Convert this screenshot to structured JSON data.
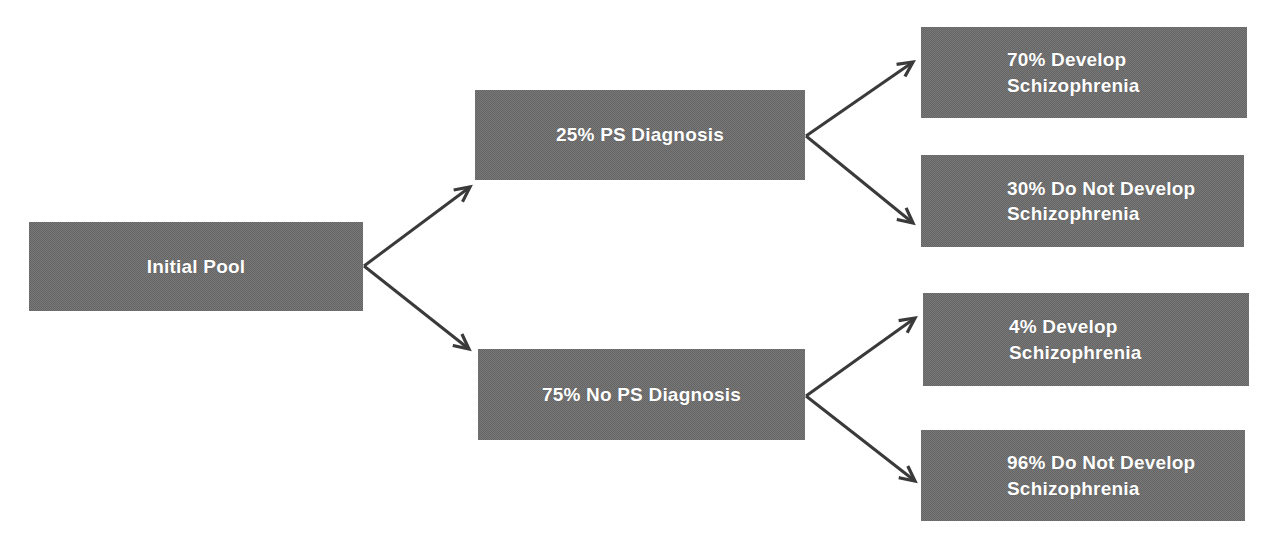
{
  "diagram": {
    "type": "flowchart",
    "title": "",
    "background_color": "#ffffff",
    "node_fill_color": "#787878",
    "node_text_color": "#ffffff",
    "edge_color": "#3a3a3a",
    "nodes": [
      {
        "id": "initial-pool",
        "label": "Initial Pool",
        "level": 0,
        "x": 29,
        "y": 222,
        "w": 334,
        "h": 89,
        "align": "center"
      },
      {
        "id": "ps-diagnosis",
        "label": "25% PS Diagnosis",
        "level": 1,
        "x": 475,
        "y": 90,
        "w": 330,
        "h": 90,
        "align": "center"
      },
      {
        "id": "no-ps-diagnosis",
        "label": "75% No PS Diagnosis",
        "level": 1,
        "x": 478,
        "y": 349,
        "w": 327,
        "h": 91,
        "align": "center"
      },
      {
        "id": "ps-develop",
        "label": "70% Develop\nSchizophrenia",
        "level": 2,
        "x": 921,
        "y": 27,
        "w": 326,
        "h": 91,
        "align": "indent"
      },
      {
        "id": "ps-not-develop",
        "label": "30% Do Not Develop\nSchizophrenia",
        "level": 2,
        "x": 921,
        "y": 155,
        "w": 323,
        "h": 92,
        "align": "indent"
      },
      {
        "id": "no-ps-develop",
        "label": "4% Develop\nSchizophrenia",
        "level": 2,
        "x": 923,
        "y": 293,
        "w": 326,
        "h": 93,
        "align": "indent"
      },
      {
        "id": "no-ps-not-develop",
        "label": "96% Do Not Develop\nSchizophrenia",
        "level": 2,
        "x": 921,
        "y": 430,
        "w": 324,
        "h": 91,
        "align": "indent"
      }
    ],
    "edges": [
      {
        "id": "edge-initial-to-ps",
        "from": "initial-pool",
        "to": "ps-diagnosis",
        "x1": 364,
        "y1": 266,
        "x2": 470,
        "y2": 187
      },
      {
        "id": "edge-initial-to-no-ps",
        "from": "initial-pool",
        "to": "no-ps-diagnosis",
        "x1": 364,
        "y1": 266,
        "x2": 469,
        "y2": 349
      },
      {
        "id": "edge-ps-to-develop",
        "from": "ps-diagnosis",
        "to": "ps-develop",
        "x1": 806,
        "y1": 136,
        "x2": 913,
        "y2": 62
      },
      {
        "id": "edge-ps-to-not-develop",
        "from": "ps-diagnosis",
        "to": "ps-not-develop",
        "x1": 806,
        "y1": 136,
        "x2": 913,
        "y2": 223
      },
      {
        "id": "edge-no-ps-to-develop",
        "from": "no-ps-diagnosis",
        "to": "no-ps-develop",
        "x1": 806,
        "y1": 396,
        "x2": 915,
        "y2": 318
      },
      {
        "id": "edge-no-ps-to-not-develop",
        "from": "no-ps-diagnosis",
        "to": "no-ps-not-develop",
        "x1": 806,
        "y1": 396,
        "x2": 915,
        "y2": 481
      }
    ]
  }
}
